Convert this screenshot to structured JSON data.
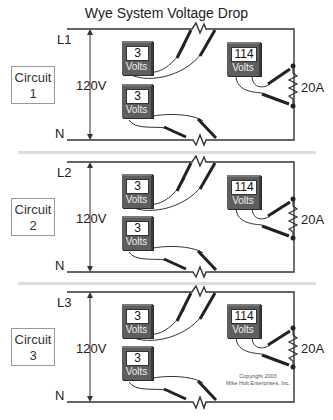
{
  "title": "Wye System Voltage Drop",
  "colors": {
    "wire": "#333333",
    "meter_body": "#5e5e5e",
    "display_bg": "#ffffff",
    "divider": "#dddddd",
    "circuit_box_border": "#999999"
  },
  "circuits": [
    {
      "box_label_line1": "Circuit",
      "box_label_line2": "1",
      "line_label": "L1",
      "neutral_label": "N",
      "source_voltage": "120V",
      "meter_line": {
        "value": "3",
        "unit": "Volts"
      },
      "meter_neutral": {
        "value": "3",
        "unit": "Volts"
      },
      "meter_load": {
        "value": "114",
        "unit": "Volts"
      },
      "load_current": "20A"
    },
    {
      "box_label_line1": "Circuit",
      "box_label_line2": "2",
      "line_label": "L2",
      "neutral_label": "N",
      "source_voltage": "120V",
      "meter_line": {
        "value": "3",
        "unit": "Volts"
      },
      "meter_neutral": {
        "value": "3",
        "unit": "Volts"
      },
      "meter_load": {
        "value": "114",
        "unit": "Volts"
      },
      "load_current": "20A"
    },
    {
      "box_label_line1": "Circuit",
      "box_label_line2": "3",
      "line_label": "L3",
      "neutral_label": "N",
      "source_voltage": "120V",
      "meter_line": {
        "value": "3",
        "unit": "Volts"
      },
      "meter_neutral": {
        "value": "3",
        "unit": "Volts"
      },
      "meter_load": {
        "value": "114",
        "unit": "Volts"
      },
      "load_current": "20A"
    }
  ],
  "copyright": {
    "line1": "Copyright 2003",
    "line2": "Mike Holt Enterprises, Inc."
  }
}
